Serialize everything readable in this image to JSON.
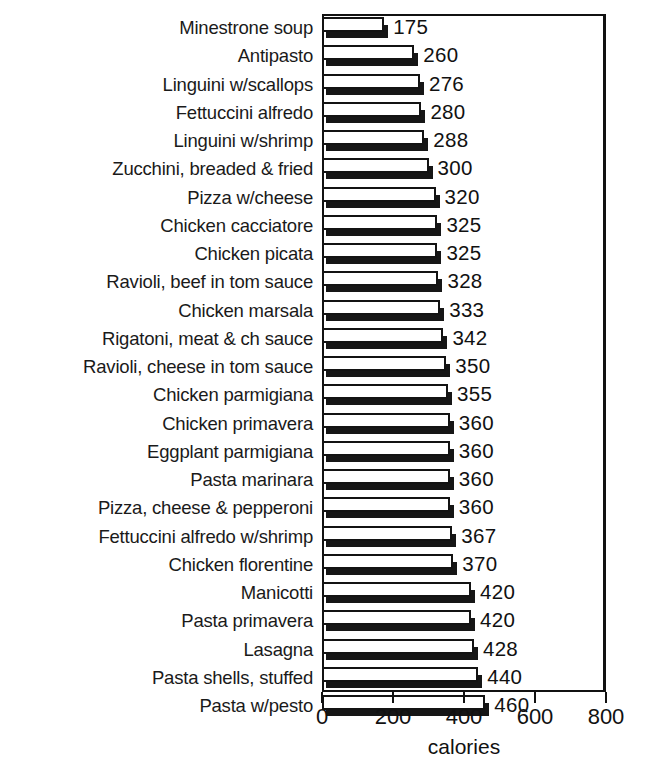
{
  "chart_data": {
    "type": "bar",
    "orientation": "horizontal",
    "title": "",
    "xlabel": "calories",
    "ylabel": "",
    "xlim": [
      0,
      800
    ],
    "xticks": [
      0,
      200,
      400,
      600,
      800
    ],
    "xtick_labels": [
      "0",
      "200",
      "400",
      "600",
      "800"
    ],
    "grid": false,
    "legend": null,
    "categories": [
      "Minestrone soup",
      "Antipasto",
      "Linguini  w/scallops",
      "Fettuccini alfredo",
      "Linguini w/shrimp",
      "Zucchini, breaded & fried",
      "Pizza w/cheese",
      "Chicken cacciatore",
      "Chicken picata",
      "Ravioli, beef in tom sauce",
      "Chicken marsala",
      "Rigatoni, meat & ch sauce",
      "Ravioli, cheese in tom sauce",
      "Chicken parmigiana",
      "Chicken primavera",
      "Eggplant parmigiana",
      "Pasta marinara",
      "Pizza, cheese & pepperoni",
      "Fettuccini alfredo w/shrimp",
      "Chicken florentine",
      "Manicotti",
      "Pasta primavera",
      "Lasagna",
      "Pasta shells, stuffed",
      "Pasta w/pesto"
    ],
    "values": [
      175,
      260,
      276,
      280,
      288,
      300,
      320,
      325,
      325,
      328,
      333,
      342,
      350,
      355,
      360,
      360,
      360,
      360,
      367,
      370,
      420,
      420,
      428,
      440,
      460
    ],
    "value_labels": [
      "175",
      "260",
      "276",
      "280",
      "288",
      "300",
      "320",
      "325",
      "325",
      "328",
      "333",
      "342",
      "350",
      "355",
      "360",
      "360",
      "360",
      "360",
      "367",
      "370",
      "420",
      "420",
      "428",
      "440",
      "460"
    ],
    "colors": {
      "bar_face": "#ffffff",
      "bar_outline": "#131313",
      "bar_shadow": "#161616",
      "axis": "#111111",
      "text": "#111111",
      "background": "#ffffff"
    }
  },
  "title_sliver": ""
}
